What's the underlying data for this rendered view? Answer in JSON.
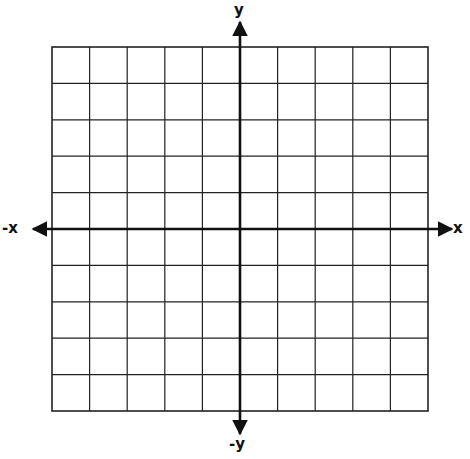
{
  "diagram": {
    "type": "coordinate-plane",
    "grid": {
      "columns": 10,
      "rows": 10,
      "left": 52,
      "top": 47,
      "right": 428,
      "bottom": 411,
      "line_color": "#222222",
      "line_width": 1.2
    },
    "axes": {
      "origin": {
        "x": 240,
        "y": 229
      },
      "color": "#111111",
      "width": 2.6,
      "x_axis": {
        "from": 33,
        "to": 452,
        "arrows": "both"
      },
      "y_axis": {
        "from": 22,
        "to": 434,
        "arrows": "both"
      }
    },
    "labels": {
      "x_positive": "x",
      "x_negative": "-x",
      "y_positive": "y",
      "y_negative": "-y"
    }
  }
}
